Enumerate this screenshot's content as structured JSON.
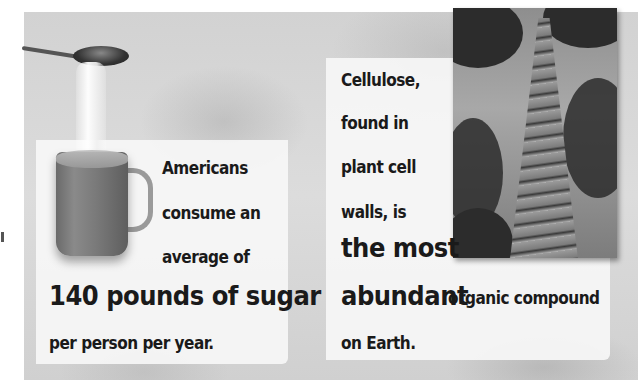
{
  "left_panel": {
    "line1": "Americans",
    "line2": "consume an",
    "line3": "average of",
    "highlight": "140 pounds of sugar",
    "line5": "per person per year."
  },
  "right_panel": {
    "line1": "Cellulose,",
    "line2": "found in",
    "line3": "plant cell",
    "line4": "walls, is",
    "highlight1": "the most",
    "highlight2": "abundant",
    "line6_tail": "organic compound",
    "line7": "on Earth."
  },
  "images": {
    "left": "spoon-pouring-sugar-into-mug",
    "right": "tall-tree-trunk-looking-up"
  },
  "colors": {
    "text": "#1a1a1a",
    "background": "#d4d4d4",
    "panel": "#f6f6f6"
  }
}
